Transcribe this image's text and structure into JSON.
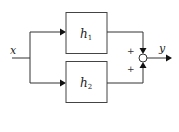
{
  "diagram": {
    "type": "block-diagram",
    "input": {
      "label": "x"
    },
    "output": {
      "label": "y"
    },
    "blocks": [
      {
        "id": "h1",
        "label": "h",
        "subscript": "1"
      },
      {
        "id": "h2",
        "label": "h",
        "subscript": "2"
      }
    ],
    "summing_junction": {
      "signs": [
        "+",
        "+"
      ]
    },
    "edges": [
      {
        "from": "x",
        "to": "h1"
      },
      {
        "from": "x",
        "to": "h2"
      },
      {
        "from": "h1",
        "to": "sum",
        "sign": "+"
      },
      {
        "from": "h2",
        "to": "sum",
        "sign": "+"
      },
      {
        "from": "sum",
        "to": "y"
      }
    ]
  }
}
